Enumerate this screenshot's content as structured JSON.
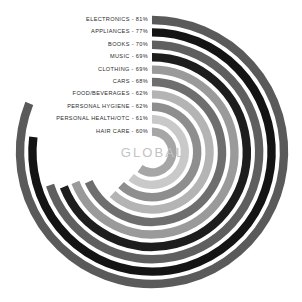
{
  "chart_data": {
    "type": "bar",
    "subtype": "radial-bar",
    "title": "GLOBAL",
    "xlabel": "",
    "ylabel": "",
    "units": "percent",
    "value_suffix": "%",
    "label_separator": " - ",
    "grid": false,
    "legend_position": "inline-left",
    "ylim": [
      0,
      100
    ],
    "categories": [
      "ELECTRONICS",
      "APPLIANCES",
      "BOOKS",
      "MUSIC",
      "CLOTHING",
      "CARS",
      "FOOD/BEVERAGES",
      "PERSONAL HYGIENE",
      "PERSONAL HEALTH/OTC",
      "HAIR CARE"
    ],
    "values": [
      81,
      77,
      70,
      69,
      69,
      68,
      62,
      62,
      61,
      60
    ],
    "colors": [
      "#5a5a5a",
      "#141414",
      "#5f5f5f",
      "#1d1d1d",
      "#9a9a9a",
      "#6e6e6e",
      "#b4b4b4",
      "#8e8e8e",
      "#c9c9c9",
      "#a6a6a6"
    ],
    "labels": [
      "ELECTRONICS - 81%",
      "APPLIANCES - 77%",
      "BOOKS - 70%",
      "MUSIC - 69%",
      "CLOTHING - 69%",
      "CARS - 68%",
      "FOOD/BEVERAGES - 62%",
      "PERSONAL HYGIENE - 62%",
      "PERSONAL HEALTH/OTC - 61%",
      "HAIR CARE - 60%"
    ],
    "center_label": "GLOBAL",
    "center_label_color": "#c3c3c3",
    "background_color": "#ffffff",
    "label_text_color": "#2b2b2b",
    "geometry": {
      "center_x": 152,
      "center_y": 152,
      "start_angle_deg": 0,
      "direction": "clockwise",
      "outer_radius": 132,
      "ring_step": 12.4,
      "ring_thickness": 8.4
    }
  }
}
